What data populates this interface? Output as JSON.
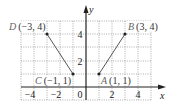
{
  "figure": {
    "axes": {
      "x_label": "x",
      "y_label": "y",
      "x_ticks": [
        {
          "value": -4,
          "label": "−4"
        },
        {
          "value": -2,
          "label": "−2"
        },
        {
          "value": 0,
          "label": "0"
        },
        {
          "value": 2,
          "label": "2"
        },
        {
          "value": 4,
          "label": "4"
        }
      ],
      "y_ticks": [
        {
          "value": 2,
          "label": "2"
        },
        {
          "value": 4,
          "label": "4"
        }
      ],
      "grid_range": {
        "x": [
          -5,
          5
        ],
        "y": [
          -1,
          5
        ]
      },
      "grid_style": "dotted"
    },
    "points": [
      {
        "name": "A",
        "coords": "(1, 1)",
        "x": 1,
        "y": 1
      },
      {
        "name": "B",
        "coords": "(3, 4)",
        "x": 3,
        "y": 4
      },
      {
        "name": "C",
        "coords": "(−1, 1)",
        "x": -1,
        "y": 1
      },
      {
        "name": "D",
        "coords": "(−3, 4)",
        "x": -3,
        "y": 4
      }
    ],
    "segments": [
      {
        "from": "A",
        "to": "B"
      },
      {
        "from": "C",
        "to": "D"
      }
    ],
    "colors": {
      "axis": "#222222",
      "grid": "#777777",
      "segment": "#444444",
      "point": "#222222"
    }
  }
}
